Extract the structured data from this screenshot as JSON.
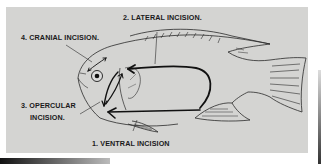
{
  "diagram": {
    "background_color": "#d4d4d2",
    "line_color": "#1a1a1a",
    "labels": {
      "lateral": "2. LATERAL INCISION.",
      "cranial": "4. CRANIAL INCISION.",
      "opercular_line1": "3. OPERCULAR",
      "opercular_line2": "INCISION.",
      "ventral": "1. VENTRAL INCISION"
    }
  }
}
